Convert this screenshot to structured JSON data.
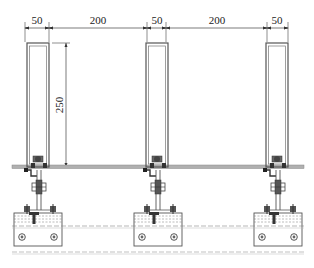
{
  "drawing": {
    "type": "technical-section",
    "units": "mm",
    "colors": {
      "line": "#444444",
      "rail": "#9a9a9a",
      "dashed": "#888888",
      "background": "#ffffff"
    }
  },
  "dimensions": {
    "horizontal": [
      {
        "label": "50",
        "x1": 25,
        "x2": 49
      },
      {
        "label": "200",
        "x1": 49,
        "x2": 147
      },
      {
        "label": "50",
        "x1": 147,
        "x2": 166
      },
      {
        "label": "200",
        "x1": 166,
        "x2": 267
      },
      {
        "label": "50",
        "x1": 267,
        "x2": 288
      }
    ],
    "vertical": {
      "label": "250",
      "y1": 43,
      "y2": 167
    }
  },
  "mullions": [
    {
      "id": "mullion-1",
      "x": 26,
      "w": 23
    },
    {
      "id": "mullion-2",
      "x": 147,
      "w": 20
    },
    {
      "id": "mullion-3",
      "x": 267,
      "w": 21
    }
  ],
  "brackets": [
    {
      "id": "bracket-1",
      "x": 38
    },
    {
      "id": "bracket-2",
      "x": 157
    },
    {
      "id": "bracket-3",
      "x": 277
    }
  ]
}
